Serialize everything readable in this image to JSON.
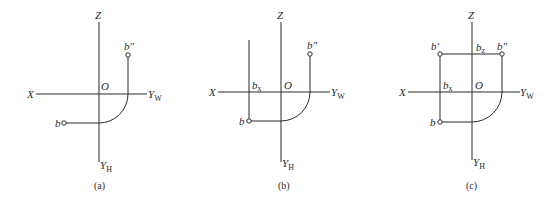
{
  "figure": {
    "panels": [
      {
        "id": "a",
        "caption": "(a)",
        "labels": {
          "z": "Z",
          "x": "X",
          "o": "O",
          "yw": "Y",
          "yw_sub": "W",
          "yh": "Y",
          "yh_sub": "H",
          "b": "b",
          "b2": "b″"
        }
      },
      {
        "id": "b",
        "caption": "(b)",
        "labels": {
          "z": "Z",
          "x": "X",
          "o": "O",
          "yw": "Y",
          "yw_sub": "W",
          "yh": "Y",
          "yh_sub": "H",
          "b": "b",
          "b2": "b″",
          "bx": "b",
          "bx_sub": "x"
        }
      },
      {
        "id": "c",
        "caption": "(c)",
        "labels": {
          "z": "Z",
          "x": "X",
          "o": "O",
          "yw": "Y",
          "yw_sub": "W",
          "yh": "Y",
          "yh_sub": "H",
          "b": "b",
          "b1": "b′",
          "b2": "b″",
          "bx": "b",
          "bx_sub": "x",
          "bz": "b",
          "bz_sub": "z"
        }
      }
    ]
  }
}
